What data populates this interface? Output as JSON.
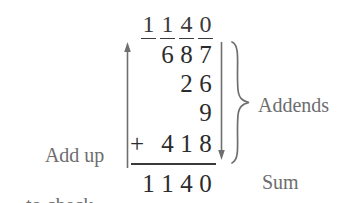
{
  "problem": {
    "type": "column-addition",
    "carry_row": [
      "1",
      "1",
      "4",
      "0"
    ],
    "operator": "+",
    "addends": [
      {
        "digits": [
          "",
          "6",
          "8",
          "7"
        ],
        "value": "687"
      },
      {
        "digits": [
          "",
          "",
          "2",
          "6"
        ],
        "value": "26"
      },
      {
        "digits": [
          "",
          "",
          "",
          "9"
        ],
        "value": "9"
      },
      {
        "digits": [
          "",
          "4",
          "1",
          "8"
        ],
        "value": "418"
      }
    ],
    "sum_row": [
      "1",
      "1",
      "4",
      "0"
    ],
    "sum_value": "1140"
  },
  "labels": {
    "add_up_line1": "Add up",
    "add_up_line2": "to check.",
    "addends": "Addends",
    "sum": "Sum"
  },
  "icons": {
    "up_arrow": "arrow-up-icon",
    "down_arrow": "arrow-down-icon",
    "brace": "curly-brace-icon"
  },
  "colors": {
    "background": "#ffffff",
    "digits": "#2b2b2b",
    "labels": "#6d6d6d",
    "rules": "#3a3a3a",
    "arrows": "#6f6f6f"
  }
}
